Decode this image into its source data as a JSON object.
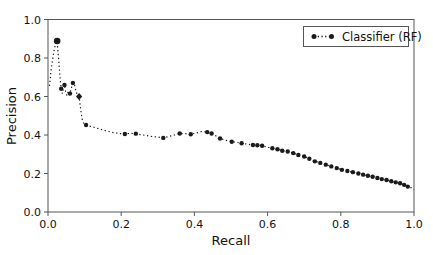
{
  "chart_data": {
    "type": "line",
    "title": "",
    "xlabel": "Recall",
    "ylabel": "Precision",
    "xlim": [
      0.0,
      1.0
    ],
    "ylim": [
      0.0,
      1.0
    ],
    "x_ticks": [
      0.0,
      0.2,
      0.4,
      0.6,
      0.8,
      1.0
    ],
    "x_tick_labels": [
      "0.0",
      "0.2",
      "0.4",
      "0.6",
      "0.8",
      "1.0"
    ],
    "y_ticks": [
      0.0,
      0.2,
      0.4,
      0.6,
      0.8,
      1.0
    ],
    "y_tick_labels": [
      "0.0",
      "0.2",
      "0.4",
      "0.6",
      "0.8",
      "1.0"
    ],
    "grid": false,
    "legend_position": "upper right",
    "line_style": "dotted",
    "color": "#1a1a1a",
    "axis_color": "#555555",
    "point_format": "[recall, precision, marker] marker: 0=none 1=dot 2=large-dot 3=diamond",
    "series": [
      {
        "name": "Classifier (RF)",
        "points": [
          [
            0.004,
            0.655,
            0
          ],
          [
            0.006,
            0.69,
            0
          ],
          [
            0.008,
            0.73,
            0
          ],
          [
            0.011,
            0.77,
            0
          ],
          [
            0.014,
            0.81,
            0
          ],
          [
            0.018,
            0.855,
            0
          ],
          [
            0.025,
            0.888,
            2
          ],
          [
            0.028,
            0.82,
            0
          ],
          [
            0.03,
            0.77,
            0
          ],
          [
            0.032,
            0.72,
            0
          ],
          [
            0.034,
            0.68,
            0
          ],
          [
            0.036,
            0.64,
            1
          ],
          [
            0.039,
            0.615,
            0
          ],
          [
            0.042,
            0.64,
            0
          ],
          [
            0.045,
            0.66,
            1
          ],
          [
            0.048,
            0.625,
            0
          ],
          [
            0.052,
            0.605,
            0
          ],
          [
            0.056,
            0.63,
            0
          ],
          [
            0.06,
            0.615,
            1
          ],
          [
            0.064,
            0.645,
            0
          ],
          [
            0.068,
            0.67,
            1
          ],
          [
            0.072,
            0.665,
            0
          ],
          [
            0.076,
            0.63,
            0
          ],
          [
            0.08,
            0.61,
            0
          ],
          [
            0.085,
            0.6,
            3
          ],
          [
            0.088,
            0.555,
            0
          ],
          [
            0.091,
            0.51,
            0
          ],
          [
            0.094,
            0.475,
            0
          ],
          [
            0.098,
            0.458,
            0
          ],
          [
            0.104,
            0.452,
            1
          ],
          [
            0.112,
            0.447,
            0
          ],
          [
            0.122,
            0.442,
            0
          ],
          [
            0.135,
            0.435,
            0
          ],
          [
            0.15,
            0.426,
            0
          ],
          [
            0.165,
            0.418,
            0
          ],
          [
            0.18,
            0.412,
            0
          ],
          [
            0.195,
            0.408,
            0
          ],
          [
            0.21,
            0.405,
            1
          ],
          [
            0.225,
            0.409,
            0
          ],
          [
            0.24,
            0.407,
            1
          ],
          [
            0.26,
            0.4,
            0
          ],
          [
            0.28,
            0.393,
            0
          ],
          [
            0.3,
            0.389,
            0
          ],
          [
            0.315,
            0.385,
            1
          ],
          [
            0.33,
            0.392,
            0
          ],
          [
            0.345,
            0.4,
            0
          ],
          [
            0.36,
            0.408,
            1
          ],
          [
            0.375,
            0.407,
            0
          ],
          [
            0.39,
            0.404,
            1
          ],
          [
            0.405,
            0.41,
            0
          ],
          [
            0.42,
            0.418,
            0
          ],
          [
            0.435,
            0.415,
            1
          ],
          [
            0.447,
            0.408,
            1
          ],
          [
            0.46,
            0.394,
            0
          ],
          [
            0.47,
            0.382,
            1
          ],
          [
            0.485,
            0.373,
            0
          ],
          [
            0.502,
            0.365,
            1
          ],
          [
            0.515,
            0.362,
            0
          ],
          [
            0.529,
            0.357,
            1
          ],
          [
            0.545,
            0.352,
            0
          ],
          [
            0.56,
            0.348,
            1
          ],
          [
            0.572,
            0.347,
            1
          ],
          [
            0.585,
            0.344,
            1
          ],
          [
            0.6,
            0.337,
            0
          ],
          [
            0.613,
            0.331,
            1
          ],
          [
            0.627,
            0.326,
            1
          ],
          [
            0.64,
            0.318,
            1
          ],
          [
            0.655,
            0.314,
            1
          ],
          [
            0.67,
            0.306,
            1
          ],
          [
            0.684,
            0.296,
            1
          ],
          [
            0.7,
            0.288,
            1
          ],
          [
            0.714,
            0.277,
            1
          ],
          [
            0.729,
            0.263,
            1
          ],
          [
            0.744,
            0.255,
            1
          ],
          [
            0.759,
            0.246,
            1
          ],
          [
            0.774,
            0.237,
            1
          ],
          [
            0.789,
            0.228,
            1
          ],
          [
            0.803,
            0.219,
            1
          ],
          [
            0.818,
            0.213,
            1
          ],
          [
            0.833,
            0.207,
            1
          ],
          [
            0.848,
            0.2,
            1
          ],
          [
            0.861,
            0.194,
            1
          ],
          [
            0.874,
            0.188,
            1
          ],
          [
            0.887,
            0.183,
            1
          ],
          [
            0.9,
            0.177,
            1
          ],
          [
            0.912,
            0.171,
            1
          ],
          [
            0.925,
            0.166,
            1
          ],
          [
            0.938,
            0.16,
            1
          ],
          [
            0.95,
            0.154,
            1
          ],
          [
            0.962,
            0.149,
            1
          ],
          [
            0.973,
            0.141,
            1
          ],
          [
            0.983,
            0.132,
            1
          ],
          [
            0.993,
            0.125,
            0
          ],
          [
            1.0,
            0.116,
            0
          ]
        ]
      }
    ]
  }
}
